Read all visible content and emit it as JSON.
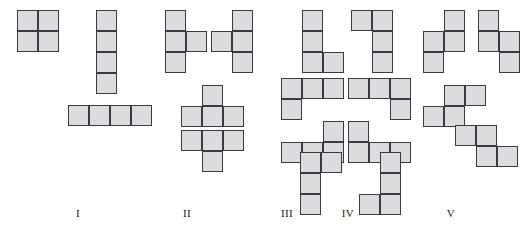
{
  "figure": {
    "background_color": "#ffffff",
    "cell_fill_color": "#dcdcdf",
    "cell_stroke_color": "#3a3a42",
    "cell_size": 21,
    "groups": [
      {
        "label": "I",
        "label_x": 78,
        "label_y": 207,
        "name": "group-i",
        "pieces": [
          {
            "name": "square-o-tetromino",
            "x": 17,
            "y": 10,
            "cells": [
              [
                0,
                0
              ],
              [
                1,
                0
              ],
              [
                0,
                1
              ],
              [
                1,
                1
              ]
            ]
          }
        ]
      },
      {
        "label": "II",
        "label_x": 187,
        "label_y": 207,
        "name": "group-ii",
        "pieces": [
          {
            "name": "i-tetromino-vertical",
            "x": 96,
            "y": 10,
            "cells": [
              [
                0,
                0
              ],
              [
                0,
                1
              ],
              [
                0,
                2
              ],
              [
                0,
                3
              ]
            ]
          },
          {
            "name": "i-tetromino-horizontal",
            "x": 68,
            "y": 105,
            "cells": [
              [
                0,
                0
              ],
              [
                1,
                0
              ],
              [
                2,
                0
              ],
              [
                3,
                0
              ]
            ]
          }
        ]
      },
      {
        "label": "III",
        "label_x": 287,
        "label_y": 207,
        "name": "group-iii",
        "pieces": [
          {
            "name": "t-tetromino-right",
            "x": 165,
            "y": 10,
            "cells": [
              [
                0,
                0
              ],
              [
                0,
                1
              ],
              [
                1,
                1
              ],
              [
                0,
                2
              ]
            ]
          },
          {
            "name": "t-tetromino-left",
            "x": 211,
            "y": 10,
            "cells": [
              [
                1,
                0
              ],
              [
                0,
                1
              ],
              [
                1,
                1
              ],
              [
                1,
                2
              ]
            ]
          },
          {
            "name": "t-tetromino-up",
            "x": 181,
            "y": 85,
            "cells": [
              [
                1,
                0
              ],
              [
                0,
                1
              ],
              [
                1,
                1
              ],
              [
                2,
                1
              ]
            ]
          },
          {
            "name": "t-tetromino-down",
            "x": 181,
            "y": 130,
            "cells": [
              [
                0,
                0
              ],
              [
                1,
                0
              ],
              [
                2,
                0
              ],
              [
                1,
                1
              ]
            ]
          }
        ]
      },
      {
        "label": "IV",
        "label_x": 348,
        "label_y": 207,
        "name": "group-iv",
        "pieces": [
          {
            "name": "l-tetromino-vertical",
            "x": 302,
            "y": 10,
            "cells": [
              [
                0,
                0
              ],
              [
                0,
                1
              ],
              [
                0,
                2
              ],
              [
                1,
                2
              ]
            ]
          },
          {
            "name": "j-tetromino-vertical",
            "x": 351,
            "y": 10,
            "cells": [
              [
                0,
                0
              ],
              [
                1,
                0
              ],
              [
                1,
                1
              ],
              [
                1,
                2
              ]
            ]
          },
          {
            "name": "j-tetromino-horizontal",
            "x": 281,
            "y": 78,
            "cells": [
              [
                0,
                0
              ],
              [
                1,
                0
              ],
              [
                2,
                0
              ],
              [
                0,
                1
              ]
            ]
          },
          {
            "name": "l-tetromino-horizontal",
            "x": 348,
            "y": 78,
            "cells": [
              [
                0,
                0
              ],
              [
                1,
                0
              ],
              [
                2,
                0
              ],
              [
                2,
                1
              ]
            ]
          },
          {
            "name": "l-tetromino-horizontal-2",
            "x": 281,
            "y": 121,
            "cells": [
              [
                2,
                0
              ],
              [
                0,
                1
              ],
              [
                1,
                1
              ],
              [
                2,
                1
              ]
            ]
          },
          {
            "name": "j-tetromino-horizontal-2",
            "x": 348,
            "y": 121,
            "cells": [
              [
                0,
                0
              ],
              [
                0,
                1
              ],
              [
                1,
                1
              ],
              [
                2,
                1
              ]
            ]
          },
          {
            "name": "j-tetromino-vertical-2",
            "x": 300,
            "y": 152,
            "cells": [
              [
                0,
                0
              ],
              [
                1,
                0
              ],
              [
                0,
                1
              ],
              [
                0,
                2
              ]
            ]
          },
          {
            "name": "l-tetromino-vertical-2",
            "x": 359,
            "y": 152,
            "cells": [
              [
                1,
                0
              ],
              [
                1,
                1
              ],
              [
                0,
                2
              ],
              [
                1,
                2
              ]
            ]
          }
        ]
      },
      {
        "label": "V",
        "label_x": 451,
        "label_y": 207,
        "name": "group-v",
        "pieces": [
          {
            "name": "s-tetromino-vertical",
            "x": 423,
            "y": 10,
            "cells": [
              [
                1,
                0
              ],
              [
                0,
                1
              ],
              [
                1,
                1
              ],
              [
                0,
                2
              ]
            ]
          },
          {
            "name": "z-tetromino-vertical",
            "x": 478,
            "y": 10,
            "cells": [
              [
                0,
                0
              ],
              [
                0,
                1
              ],
              [
                1,
                1
              ],
              [
                1,
                2
              ]
            ]
          },
          {
            "name": "s-tetromino-horizontal",
            "x": 423,
            "y": 85,
            "cells": [
              [
                1,
                0
              ],
              [
                2,
                0
              ],
              [
                0,
                1
              ],
              [
                1,
                1
              ]
            ]
          },
          {
            "name": "z-tetromino-horizontal",
            "x": 455,
            "y": 125,
            "cells": [
              [
                0,
                0
              ],
              [
                1,
                0
              ],
              [
                1,
                1
              ],
              [
                2,
                1
              ]
            ]
          }
        ]
      }
    ]
  }
}
